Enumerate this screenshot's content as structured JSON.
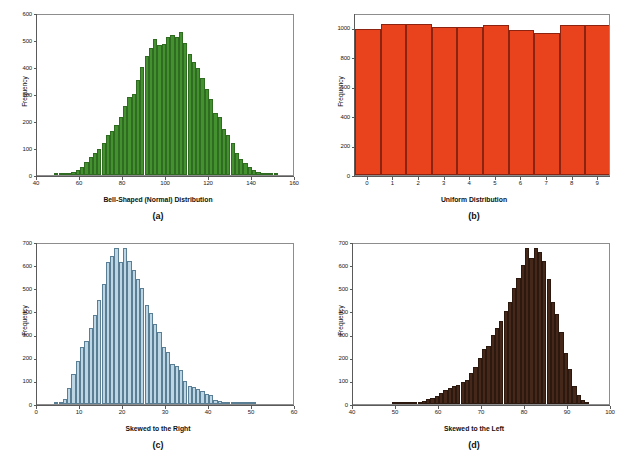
{
  "figure": {
    "background": "#ffffff",
    "axis_color": "#5a5a5a",
    "frame_color": "#8d8d8d",
    "text_color": "#111111"
  },
  "panels": [
    {
      "id": "panel-a",
      "caption": "(a)",
      "ylabel": "Frequency",
      "chart_data": {
        "type": "bar",
        "title": "",
        "subtitle": "",
        "xlabel": "Bell-Shaped (Normal) Distribution",
        "ylabel": "Frequency",
        "xlim": [
          40,
          160
        ],
        "ylim": [
          0,
          600
        ],
        "xticks": [
          40,
          60,
          80,
          100,
          120,
          140,
          160
        ],
        "xtick_labels": [
          "40",
          "60",
          "80",
          "100",
          "120",
          "140",
          "160"
        ],
        "yticks": [
          0,
          100,
          200,
          300,
          400,
          500,
          600
        ],
        "ytick_labels": [
          "0",
          "100",
          "200",
          "300",
          "400",
          "500",
          "600"
        ],
        "grid": false,
        "legend": "none",
        "bar_color": "#44912f",
        "bar_edge_color": "#2f6b20",
        "bin_width": 2,
        "bin_starts": [
          48,
          50,
          52,
          54,
          56,
          58,
          60,
          62,
          64,
          66,
          68,
          70,
          72,
          74,
          76,
          78,
          80,
          82,
          84,
          86,
          88,
          90,
          92,
          94,
          96,
          98,
          100,
          102,
          104,
          106,
          108,
          110,
          112,
          114,
          116,
          118,
          120,
          122,
          124,
          126,
          128,
          130,
          132,
          134,
          136,
          138,
          140,
          142,
          144,
          146,
          148,
          150
        ],
        "values": [
          2,
          3,
          4,
          6,
          12,
          20,
          30,
          48,
          66,
          82,
          96,
          118,
          150,
          163,
          186,
          215,
          255,
          290,
          300,
          352,
          400,
          440,
          470,
          505,
          482,
          487,
          512,
          520,
          510,
          530,
          490,
          450,
          420,
          395,
          360,
          320,
          282,
          230,
          215,
          172,
          150,
          120,
          82,
          60,
          44,
          30,
          20,
          13,
          8,
          6,
          4,
          3
        ]
      }
    },
    {
      "id": "panel-b",
      "caption": "(b)",
      "ylabel": "Frequency",
      "chart_data": {
        "type": "bar",
        "title": "",
        "subtitle": "",
        "xlabel": "Uniform Distribution",
        "ylabel": "Frequency",
        "xlim": [
          -0.5,
          9.5
        ],
        "ylim": [
          0,
          1100
        ],
        "xticks": [
          0,
          1,
          2,
          3,
          4,
          5,
          6,
          7,
          8,
          9
        ],
        "xtick_labels": [
          "0",
          "1",
          "2",
          "3",
          "4",
          "5",
          "6",
          "7",
          "8",
          "9"
        ],
        "yticks": [
          0,
          200,
          400,
          600,
          800,
          1000
        ],
        "ytick_labels": [
          "0",
          "200",
          "400",
          "600",
          "800",
          "1000"
        ],
        "grid": false,
        "legend": "none",
        "bar_color": "#e8431c",
        "bar_edge_color": "#8c2310",
        "categories": [
          "0",
          "1",
          "2",
          "3",
          "4",
          "5",
          "6",
          "7",
          "8",
          "9"
        ],
        "values": [
          992,
          1027,
          1027,
          1004,
          1006,
          1017,
          984,
          962,
          1018,
          1018
        ]
      }
    },
    {
      "id": "panel-c",
      "caption": "(c)",
      "ylabel": "Frequency",
      "chart_data": {
        "type": "bar",
        "title": "",
        "subtitle": "",
        "xlabel": "Skewed to the Right",
        "ylabel": "Frequency",
        "xlim": [
          0,
          60
        ],
        "ylim": [
          0,
          700
        ],
        "xticks": [
          0,
          10,
          20,
          30,
          40,
          50,
          60
        ],
        "xtick_labels": [
          "0",
          "10",
          "20",
          "30",
          "40",
          "50",
          "60"
        ],
        "yticks": [
          0,
          100,
          200,
          300,
          400,
          500,
          600,
          700
        ],
        "ytick_labels": [
          "0",
          "100",
          "200",
          "300",
          "400",
          "500",
          "600",
          "700"
        ],
        "grid": false,
        "legend": "none",
        "bar_color": "#bcd6e6",
        "bar_edge_color": "#5a7f95",
        "bin_width": 1,
        "bin_starts": [
          4,
          5,
          6,
          7,
          8,
          9,
          10,
          11,
          12,
          13,
          14,
          15,
          16,
          17,
          18,
          19,
          20,
          21,
          22,
          23,
          24,
          25,
          26,
          27,
          28,
          29,
          30,
          31,
          32,
          33,
          34,
          35,
          36,
          37,
          38,
          39,
          40,
          41,
          42,
          43,
          44,
          45,
          46,
          47,
          48,
          49,
          50
        ],
        "values": [
          4,
          10,
          22,
          68,
          130,
          185,
          245,
          272,
          330,
          385,
          450,
          520,
          615,
          640,
          672,
          615,
          672,
          620,
          580,
          540,
          500,
          430,
          395,
          345,
          310,
          245,
          225,
          175,
          165,
          145,
          100,
          78,
          72,
          65,
          58,
          45,
          40,
          18,
          12,
          10,
          8,
          6,
          5,
          5,
          8,
          6,
          4
        ]
      }
    },
    {
      "id": "panel-d",
      "caption": "(d)",
      "ylabel": "Frequency",
      "chart_data": {
        "type": "bar",
        "title": "",
        "subtitle": "",
        "xlabel": "Skewed to the Left",
        "ylabel": "Frequency",
        "xlim": [
          40,
          100
        ],
        "ylim": [
          0,
          700
        ],
        "xticks": [
          40,
          50,
          60,
          70,
          80,
          90,
          100
        ],
        "xtick_labels": [
          "40",
          "50",
          "60",
          "70",
          "80",
          "90",
          "100"
        ],
        "yticks": [
          0,
          100,
          200,
          300,
          400,
          500,
          600,
          700
        ],
        "ytick_labels": [
          "0",
          "100",
          "200",
          "300",
          "400",
          "500",
          "600",
          "700"
        ],
        "grid": false,
        "legend": "none",
        "bar_color": "#46281a",
        "bar_edge_color": "#2b180f",
        "bin_width": 1,
        "bin_starts": [
          49,
          50,
          51,
          52,
          53,
          54,
          55,
          56,
          57,
          58,
          59,
          60,
          61,
          62,
          63,
          64,
          65,
          66,
          67,
          68,
          69,
          70,
          71,
          72,
          73,
          74,
          75,
          76,
          77,
          78,
          79,
          80,
          81,
          82,
          83,
          84,
          85,
          86,
          87,
          88,
          89,
          90,
          91,
          92,
          93,
          94
        ],
        "values": [
          3,
          5,
          5,
          6,
          6,
          8,
          10,
          14,
          20,
          26,
          34,
          48,
          62,
          70,
          78,
          82,
          95,
          102,
          135,
          160,
          200,
          238,
          250,
          300,
          330,
          360,
          400,
          440,
          500,
          545,
          600,
          672,
          630,
          672,
          655,
          620,
          540,
          440,
          390,
          310,
          220,
          150,
          78,
          40,
          18,
          8
        ]
      }
    }
  ]
}
